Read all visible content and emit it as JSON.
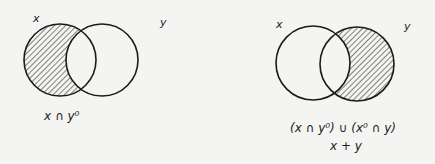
{
  "diagrams": [
    {
      "name": "x-minus-y",
      "circle_labels": [
        "x",
        "y"
      ],
      "caption": "x ∩ y⁰",
      "shaded_region": "x only"
    },
    {
      "name": "symmetric-difference-y-part",
      "circle_labels": [
        "x",
        "y"
      ],
      "caption_line1": "(x ∩ y⁰) ∪ (x⁰ ∩ y)",
      "caption_line2": "x + y",
      "shaded_region": "y only"
    }
  ],
  "colors": {
    "stroke": "#1a1a1a",
    "hatch": "#333333",
    "background": "#f4f4f2"
  }
}
